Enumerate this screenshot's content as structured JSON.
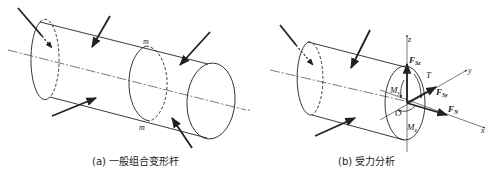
{
  "panels": [
    {
      "id": "a",
      "caption": "(a) 一般组合变形杆",
      "section_labels": [
        "m",
        "m"
      ]
    },
    {
      "id": "b",
      "caption": "(b) 受力分析",
      "axes": {
        "x": "x",
        "y": "y",
        "z": "z"
      },
      "origin": "O",
      "forces": {
        "Fsz_main": "F",
        "Fsz_sub": "Sz",
        "Fsy_main": "F",
        "Fsy_sub": "Sy",
        "FN_main": "F",
        "FN_sub": "N"
      },
      "moments": {
        "T": "T",
        "My_main": "M",
        "My_sub": "y",
        "Mz_main": "M",
        "Mz_sub": "z"
      }
    }
  ],
  "colors": {
    "stroke": "#222222",
    "background": "#ffffff"
  }
}
